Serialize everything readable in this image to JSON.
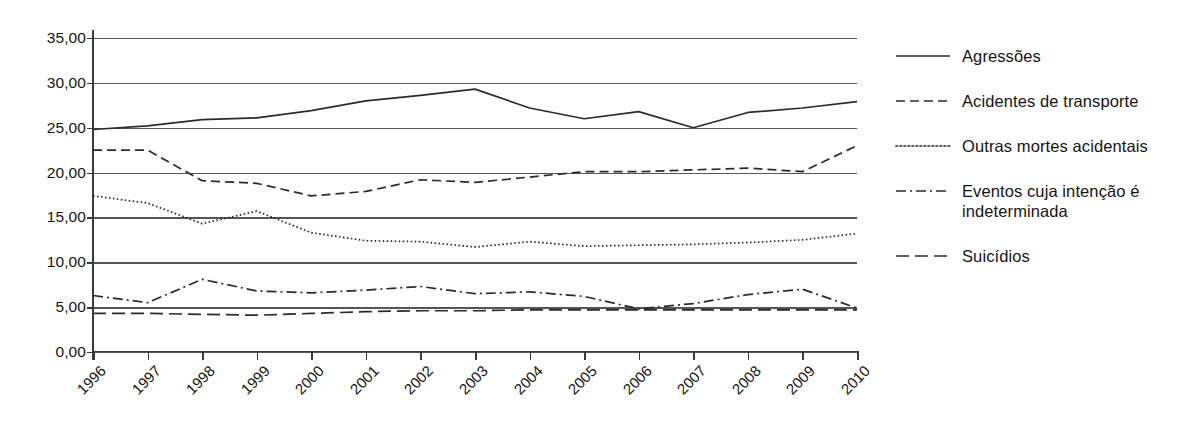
{
  "chart_data": {
    "type": "line",
    "title": "",
    "xlabel": "",
    "ylabel": "",
    "ylim": [
      0,
      35
    ],
    "ytick_labels": [
      "0,00",
      "5,00",
      "10,00",
      "15,00",
      "20,00",
      "25,00",
      "30,00",
      "35,00"
    ],
    "ytick_values": [
      0,
      5,
      10,
      15,
      20,
      25,
      30,
      35
    ],
    "grid": true,
    "legend_position": "right",
    "x": [
      "1996",
      "1997",
      "1998",
      "1999",
      "2000",
      "2001",
      "2002",
      "2003",
      "2004",
      "2005",
      "2006",
      "2007",
      "2008",
      "2009",
      "2010"
    ],
    "categories": [
      "1996",
      "1997",
      "1998",
      "1999",
      "2000",
      "2001",
      "2002",
      "2003",
      "2004",
      "2005",
      "2006",
      "2007",
      "2008",
      "2009",
      "2010"
    ],
    "series": [
      {
        "name": "Agressões",
        "line_style": "solid",
        "values": [
          24.8,
          25.2,
          25.9,
          26.1,
          26.9,
          28.0,
          28.6,
          29.3,
          27.2,
          26.0,
          26.8,
          25.0,
          26.7,
          27.2,
          27.9
        ]
      },
      {
        "name": "Acidentes de transporte",
        "line_style": "dashed",
        "values": [
          22.5,
          22.5,
          19.1,
          18.8,
          17.4,
          17.9,
          19.2,
          18.9,
          19.5,
          20.1,
          20.1,
          20.3,
          20.5,
          20.1,
          23.0
        ]
      },
      {
        "name": "Outras mortes acidentais",
        "line_style": "dotted",
        "values": [
          17.4,
          16.6,
          14.3,
          15.7,
          13.3,
          12.4,
          12.3,
          11.7,
          12.3,
          11.8,
          11.9,
          12.0,
          12.2,
          12.5,
          13.2
        ]
      },
      {
        "name": "Eventos cuja intenção é indeterminada",
        "line_style": "dash-dot",
        "values": [
          6.3,
          5.5,
          8.1,
          6.8,
          6.6,
          6.9,
          7.3,
          6.5,
          6.7,
          6.2,
          4.8,
          5.4,
          6.4,
          7.0,
          4.9
        ]
      },
      {
        "name": "Suicídios",
        "line_style": "long-dash",
        "values": [
          4.3,
          4.3,
          4.2,
          4.1,
          4.3,
          4.5,
          4.6,
          4.6,
          4.7,
          4.7,
          4.7,
          4.7,
          4.7,
          4.7,
          4.7
        ]
      }
    ]
  },
  "legend": {
    "items": [
      {
        "label": "Agressões",
        "style": "solid"
      },
      {
        "label": "Acidentes de transporte",
        "style": "dashed"
      },
      {
        "label": "Outras mortes acidentais",
        "style": "dotted"
      },
      {
        "label": "Eventos cuja intenção é indeterminada",
        "style": "dash-dot"
      },
      {
        "label": "Suicídios",
        "style": "long-dash"
      }
    ]
  }
}
